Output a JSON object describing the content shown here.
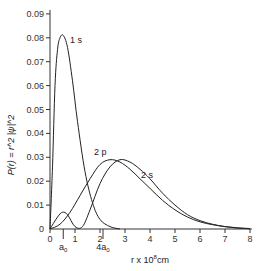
{
  "chart_data": {
    "type": "line",
    "title": "",
    "xlabel": "r x 10^8 cm",
    "xlabel_main": "r x 10",
    "xlabel_exp": "8",
    "xlabel_unit": "cm",
    "ylabel": "P(r) = r^2 |ψ|^2",
    "xlim": [
      0,
      8
    ],
    "ylim": [
      0,
      0.09
    ],
    "x_ticks": [
      "0",
      "1",
      "2",
      "3",
      "4",
      "5",
      "6",
      "7",
      "8"
    ],
    "y_ticks": [
      "0",
      "0.01",
      "0.02",
      "0.03",
      "0.04",
      "0.05",
      "0.06",
      "0.07",
      "0.08",
      "0.09"
    ],
    "annotations": [
      {
        "text": "a0",
        "x": 0.53
      },
      {
        "text": "4a0",
        "x": 2.12
      }
    ],
    "series": [
      {
        "name": "1 s",
        "x": [
          0,
          0.1,
          0.2,
          0.3,
          0.4,
          0.53,
          0.7,
          0.9,
          1.1,
          1.4,
          1.7,
          2.0,
          2.4,
          2.8
        ],
        "values": [
          0,
          0.026,
          0.06,
          0.075,
          0.08,
          0.081,
          0.076,
          0.062,
          0.045,
          0.024,
          0.011,
          0.004,
          0.001,
          0
        ]
      },
      {
        "name": "2 s",
        "x": [
          0,
          0.3,
          0.5,
          0.7,
          1.0,
          1.3,
          1.6,
          2.0,
          2.4,
          2.8,
          3.2,
          3.6,
          4.0,
          4.5,
          5.0,
          5.5,
          6.0,
          6.5,
          7.0,
          7.5,
          8.0
        ],
        "values": [
          0,
          0.005,
          0.007,
          0.006,
          0.001,
          0.001,
          0.008,
          0.019,
          0.026,
          0.029,
          0.028,
          0.025,
          0.021,
          0.015,
          0.01,
          0.006,
          0.0035,
          0.002,
          0.001,
          0.0004,
          0.0001
        ]
      },
      {
        "name": "2 p",
        "x": [
          0,
          0.4,
          0.8,
          1.2,
          1.6,
          2.0,
          2.4,
          2.8,
          3.2,
          3.6,
          4.0,
          4.5,
          5.0,
          5.5,
          6.0,
          6.5,
          7.0,
          7.5,
          8.0
        ],
        "values": [
          0,
          0.002,
          0.007,
          0.014,
          0.021,
          0.027,
          0.029,
          0.028,
          0.025,
          0.021,
          0.017,
          0.012,
          0.008,
          0.005,
          0.003,
          0.0018,
          0.001,
          0.0005,
          0.0002
        ]
      }
    ]
  }
}
